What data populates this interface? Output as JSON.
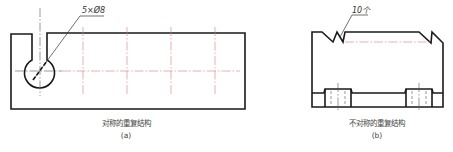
{
  "figures": [
    {
      "id": "a",
      "annotation": "5×Ø8",
      "caption": "对称的重复结构",
      "label": "(a)"
    },
    {
      "id": "b",
      "annotation": "10个",
      "caption": "不对称的重复结构",
      "label": "(b)"
    }
  ],
  "colors": {
    "outline": "#1a1a1a",
    "centerline": "#e07a7a",
    "background": "#ffffff"
  }
}
